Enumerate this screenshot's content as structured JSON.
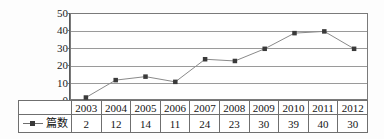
{
  "chart_data": {
    "type": "line",
    "title": "",
    "xlabel": "",
    "ylabel": "",
    "categories": [
      "2003",
      "2004",
      "2005",
      "2006",
      "2007",
      "2008",
      "2009",
      "2010",
      "2011",
      "2012"
    ],
    "series": [
      {
        "name": "篇数",
        "values": [
          2,
          12,
          14,
          11,
          24,
          23,
          30,
          39,
          40,
          30
        ],
        "marker": "square",
        "marker_color": "#3a3a3a",
        "line_color": "#8a8a8a"
      }
    ],
    "ylim": [
      0,
      50
    ],
    "y_ticks": [
      0,
      10,
      20,
      30,
      40,
      50
    ],
    "y_tick_labels": [
      "0",
      "10",
      "20",
      "30",
      "40",
      "50"
    ],
    "grid": true,
    "grid_color": "#9a9a9a",
    "legend_position": "table-left",
    "data_table_visible": true
  },
  "table": {
    "header_row": [
      "2003",
      "2004",
      "2005",
      "2006",
      "2007",
      "2008",
      "2009",
      "2010",
      "2011",
      "2012"
    ],
    "series_label": "篇数",
    "values_row": [
      "2",
      "12",
      "14",
      "11",
      "24",
      "23",
      "30",
      "39",
      "40",
      "30"
    ]
  },
  "axis": {
    "y_labels": [
      "50",
      "40",
      "30",
      "20",
      "10",
      "0"
    ]
  },
  "colors": {
    "marker": "#3a3a3a",
    "line": "#8a8a8a",
    "grid": "#9a9a9a",
    "border": "#7a7a7a",
    "text": "#141414",
    "background": "#fdfdfd"
  }
}
